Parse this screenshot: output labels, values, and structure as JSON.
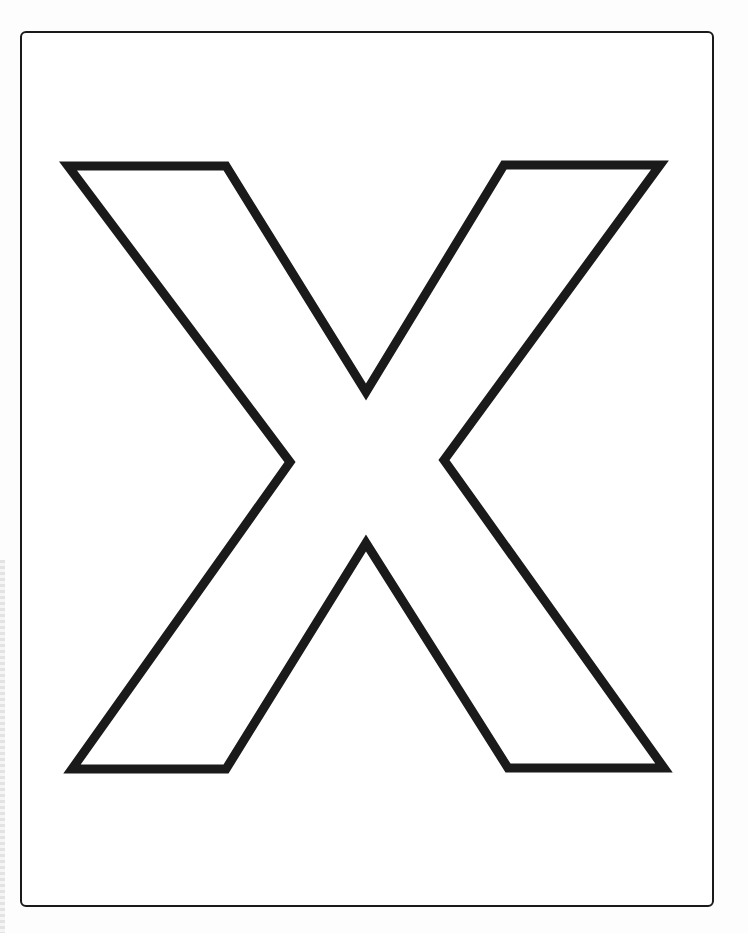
{
  "page": {
    "letter": "X",
    "background_color": "#ffffff",
    "stroke_color": "#1a1a1a",
    "frame": {
      "stroke_color": "#1a1a1a",
      "corner_radius": 6
    },
    "outline": {
      "stroke_width": 9,
      "points": [
        [
          68,
          166
        ],
        [
          226,
          166
        ],
        [
          366,
          392
        ],
        [
          504,
          165
        ],
        [
          660,
          165
        ],
        [
          444,
          460
        ],
        [
          664,
          768
        ],
        [
          508,
          768
        ],
        [
          366,
          543
        ],
        [
          226,
          769
        ],
        [
          72,
          769
        ],
        [
          290,
          462
        ]
      ]
    }
  }
}
